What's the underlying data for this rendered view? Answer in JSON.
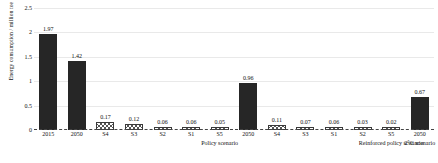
{
  "chart_data": {
    "type": "bar",
    "title": "",
    "xlabel": "",
    "ylabel": "Energy consumption / million toe",
    "ylim": [
      0,
      2.5
    ],
    "yticks": [
      "0",
      "0.5",
      "1",
      "1.5",
      "2",
      "2.5"
    ],
    "grid": true,
    "legend": "none",
    "categories": [
      "2015",
      "2050",
      "S4",
      "S3",
      "S2",
      "S1",
      "S5",
      "2050",
      "S4",
      "S3",
      "S1",
      "S2",
      "S5",
      "2050"
    ],
    "values": [
      1.97,
      1.42,
      0.17,
      0.12,
      0.06,
      0.06,
      0.05,
      0.96,
      0.11,
      0.07,
      0.06,
      0.03,
      0.02,
      0.67
    ],
    "value_labels": [
      "1.97",
      "1.42",
      "0.17",
      "0.12",
      "0.06",
      "0.06",
      "0.05",
      "0.96",
      "0.11",
      "0.07",
      "0.06",
      "0.03",
      "0.02",
      "0.67"
    ],
    "styles": [
      "solid",
      "solid",
      "hatch",
      "hatch",
      "hatch",
      "hatch",
      "hatch",
      "solid",
      "hatch",
      "hatch",
      "hatch",
      "hatch",
      "hatch",
      "solid"
    ],
    "groups": [
      {
        "label": "Policy scenario",
        "start": 0,
        "end": 6
      },
      {
        "label": "Reinforced policy scenario",
        "start": 6,
        "end": 12
      },
      {
        "label": "2°C scenario",
        "start": 12,
        "end": 13
      }
    ],
    "colors": {
      "solid_bar": "#262626",
      "hatch_line": "#555555",
      "grid": "#e9e9e9",
      "baseline": "#444444",
      "text": "#111111"
    }
  }
}
